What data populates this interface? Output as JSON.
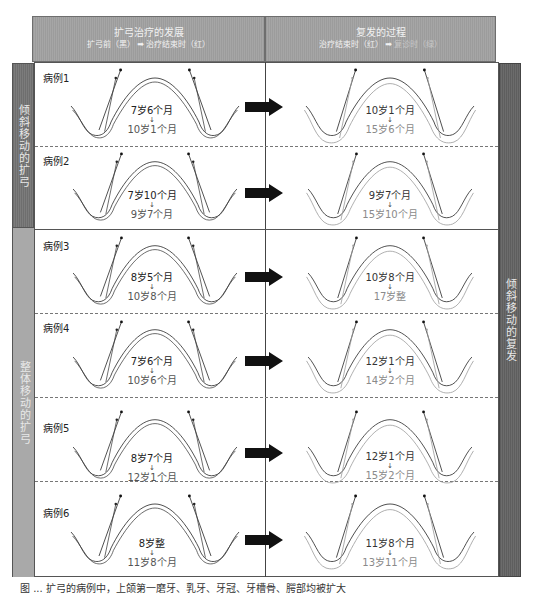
{
  "header": {
    "left": {
      "title": "扩弓治疗的发展",
      "subtitle_before": "扩弓前（黑）",
      "subtitle_arrow": "➡",
      "subtitle_after": "治疗结束时（红）"
    },
    "right": {
      "title": "复发的过程",
      "subtitle_before": "治疗结束时（红）",
      "subtitle_arrow": "➡",
      "subtitle_after": "复诊时（绿）"
    }
  },
  "side_bands": {
    "left_top": "倾斜移动的扩弓",
    "left_bottom": "整体移动的扩弓",
    "right": "倾斜移动的复发"
  },
  "cases": [
    {
      "label": "病例1",
      "treat_from": "7岁6个月",
      "treat_to": "10岁1个月",
      "relapse_from": "10岁1个月",
      "relapse_to": "15岁6个月",
      "group": "倾斜移动的扩弓"
    },
    {
      "label": "病例2",
      "treat_from": "7岁10个月",
      "treat_to": "9岁7个月",
      "relapse_from": "9岁7个月",
      "relapse_to": "15岁10个月",
      "group": "倾斜移动的扩弓"
    },
    {
      "label": "病例3",
      "treat_from": "8岁5个月",
      "treat_to": "10岁8个月",
      "relapse_from": "10岁8个月",
      "relapse_to": "17岁整",
      "group": "整体移动的扩弓"
    },
    {
      "label": "病例4",
      "treat_from": "7岁6个月",
      "treat_to": "10岁6个月",
      "relapse_from": "12岁1个月",
      "relapse_to": "14岁2个月",
      "group": "整体移动的扩弓"
    },
    {
      "label": "病例5",
      "treat_from": "8岁7个月",
      "treat_to": "12岁1个月",
      "relapse_from": "12岁1个月",
      "relapse_to": "15岁2个月",
      "group": "整体移动的扩弓"
    },
    {
      "label": "病例6",
      "treat_from": "8岁整",
      "treat_to": "11岁8个月",
      "relapse_from": "11岁8个月",
      "relapse_to": "13岁11个月",
      "group": "整体移动的扩弓"
    }
  ],
  "arrow_glyph": "↓",
  "caption": "图 ... 扩弓的病例中，上颌第一磨牙、乳牙、牙冠、牙槽骨、腭部均被扩大"
}
